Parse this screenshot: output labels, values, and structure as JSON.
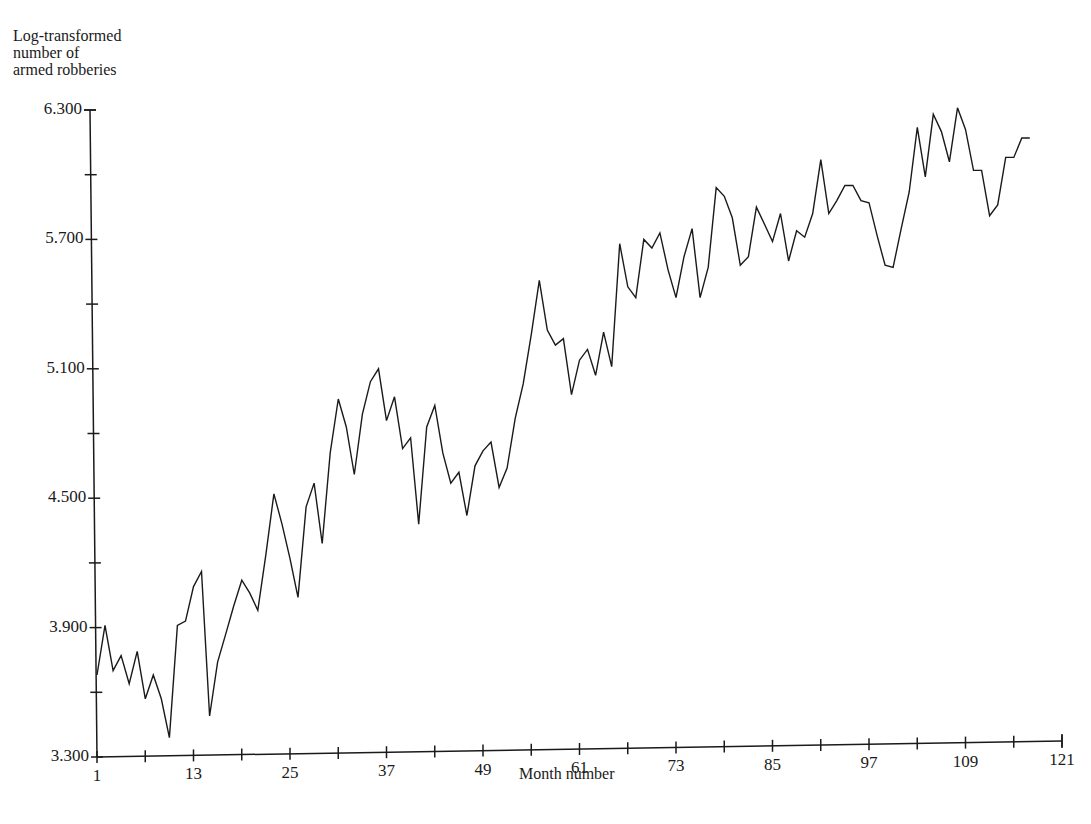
{
  "chart_data": {
    "type": "line",
    "title": "",
    "xlabel": "Month number",
    "ylabel": "Log-transformed number of armed robberies",
    "ylabel_lines": [
      "Log-transformed",
      "number of",
      "armed robberies"
    ],
    "xlim": [
      1,
      121
    ],
    "ylim": [
      3.3,
      6.3
    ],
    "x_ticks": [
      1,
      13,
      25,
      37,
      49,
      61,
      73,
      85,
      97,
      109,
      121
    ],
    "x_tick_labels": [
      "1",
      "13",
      "25",
      "37",
      "49",
      "61",
      "73",
      "85",
      "97",
      "109",
      "121"
    ],
    "x_minor_ticks": [
      7,
      19,
      31,
      43,
      55,
      67,
      79,
      91,
      103,
      115
    ],
    "y_ticks": [
      3.3,
      3.9,
      4.5,
      5.1,
      5.7,
      6.3
    ],
    "y_tick_labels": [
      "3.300",
      "3.900",
      "4.500",
      "5.100",
      "5.700",
      "6.300"
    ],
    "y_minor_ticks": [
      3.6,
      4.2,
      4.8,
      5.4,
      6.0
    ],
    "grid": false,
    "legend": null,
    "series": [
      {
        "name": "Log-transformed armed robberies",
        "color": "#1a1a1a",
        "x_start": 1,
        "values": [
          3.68,
          3.91,
          3.7,
          3.77,
          3.64,
          3.79,
          3.57,
          3.68,
          3.57,
          3.39,
          3.91,
          3.93,
          4.09,
          4.16,
          3.49,
          3.74,
          3.87,
          4.0,
          4.12,
          4.06,
          3.98,
          4.24,
          4.52,
          4.38,
          4.22,
          4.04,
          4.46,
          4.57,
          4.29,
          4.71,
          4.96,
          4.83,
          4.61,
          4.89,
          5.04,
          5.1,
          4.86,
          4.97,
          4.73,
          4.78,
          4.38,
          4.83,
          4.93,
          4.71,
          4.57,
          4.62,
          4.42,
          4.65,
          4.72,
          4.76,
          4.55,
          4.64,
          4.87,
          5.03,
          5.26,
          5.51,
          5.28,
          5.21,
          5.24,
          4.98,
          5.14,
          5.19,
          5.07,
          5.27,
          5.11,
          5.68,
          5.48,
          5.43,
          5.7,
          5.66,
          5.73,
          5.56,
          5.43,
          5.62,
          5.75,
          5.43,
          5.57,
          5.94,
          5.9,
          5.8,
          5.58,
          5.62,
          5.85,
          5.77,
          5.69,
          5.82,
          5.6,
          5.74,
          5.71,
          5.82,
          6.07,
          5.82,
          5.88,
          5.95,
          5.95,
          5.88,
          5.87,
          5.72,
          5.58,
          5.57,
          5.75,
          5.92,
          6.22,
          5.99,
          6.28,
          6.2,
          6.06,
          6.31,
          6.21,
          6.02,
          6.02,
          5.81,
          5.86,
          6.08,
          6.08,
          6.17,
          6.17
        ]
      }
    ]
  }
}
